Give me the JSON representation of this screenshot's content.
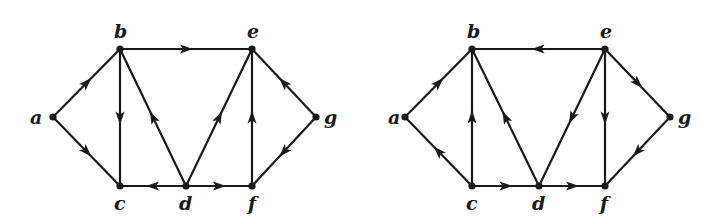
{
  "figure": {
    "graphs": [
      {
        "id": "left",
        "nodes": [
          {
            "name": "a",
            "x": 53,
            "y": 117,
            "lx": 30,
            "ly": 124
          },
          {
            "name": "b",
            "x": 120,
            "y": 49,
            "lx": 114,
            "ly": 38
          },
          {
            "name": "e",
            "x": 252,
            "y": 49,
            "lx": 247,
            "ly": 38
          },
          {
            "name": "g",
            "x": 316,
            "y": 117,
            "lx": 324,
            "ly": 124
          },
          {
            "name": "c",
            "x": 120,
            "y": 186,
            "lx": 114,
            "ly": 210
          },
          {
            "name": "d",
            "x": 186,
            "y": 186,
            "lx": 179,
            "ly": 210
          },
          {
            "name": "f",
            "x": 252,
            "y": 186,
            "lx": 248,
            "ly": 210
          }
        ],
        "edges": [
          {
            "from": "a",
            "to": "b"
          },
          {
            "from": "a",
            "to": "c"
          },
          {
            "from": "b",
            "to": "e"
          },
          {
            "from": "b",
            "to": "c"
          },
          {
            "from": "d",
            "to": "b"
          },
          {
            "from": "d",
            "to": "c"
          },
          {
            "from": "d",
            "to": "e"
          },
          {
            "from": "d",
            "to": "f"
          },
          {
            "from": "f",
            "to": "e"
          },
          {
            "from": "g",
            "to": "e"
          },
          {
            "from": "g",
            "to": "f"
          }
        ]
      },
      {
        "id": "right",
        "nodes": [
          {
            "name": "a",
            "x": 405,
            "y": 117,
            "lx": 388,
            "ly": 124
          },
          {
            "name": "b",
            "x": 472,
            "y": 49,
            "lx": 467,
            "ly": 38
          },
          {
            "name": "e",
            "x": 605,
            "y": 49,
            "lx": 600,
            "ly": 38
          },
          {
            "name": "g",
            "x": 670,
            "y": 117,
            "lx": 678,
            "ly": 124
          },
          {
            "name": "c",
            "x": 472,
            "y": 186,
            "lx": 466,
            "ly": 210
          },
          {
            "name": "d",
            "x": 539,
            "y": 186,
            "lx": 532,
            "ly": 210
          },
          {
            "name": "f",
            "x": 605,
            "y": 186,
            "lx": 600,
            "ly": 210
          }
        ],
        "edges": [
          {
            "from": "a",
            "to": "b"
          },
          {
            "from": "c",
            "to": "a"
          },
          {
            "from": "c",
            "to": "b"
          },
          {
            "from": "c",
            "to": "d"
          },
          {
            "from": "d",
            "to": "b"
          },
          {
            "from": "d",
            "to": "f"
          },
          {
            "from": "e",
            "to": "b"
          },
          {
            "from": "e",
            "to": "d"
          },
          {
            "from": "e",
            "to": "f"
          },
          {
            "from": "e",
            "to": "g"
          },
          {
            "from": "g",
            "to": "f"
          }
        ]
      }
    ]
  }
}
